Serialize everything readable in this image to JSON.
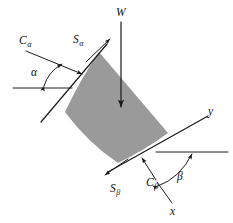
{
  "figure": {
    "background_color": "#ffffff",
    "line_color": "#1a1a1a",
    "wedge_fill_color": "#9a9a9a"
  },
  "labels": {
    "weight": "W",
    "shear_alpha_main": "S",
    "shear_alpha_sub": "α",
    "cohesion_alpha_main": "C",
    "cohesion_alpha_sub": "α",
    "shear_beta_main": "S",
    "shear_beta_sub": "β",
    "cohesion_beta_main": "C",
    "cohesion_beta_sub": "β",
    "angle_alpha": "α",
    "angle_beta": "β",
    "axis_x": "x",
    "axis_y": "y"
  },
  "elements": {
    "weight_force": {
      "name": "W",
      "description": "Vertical downward weight vector through wedge centroid",
      "direction": "down"
    },
    "shear_alpha": {
      "name": "Sα",
      "description": "Shear force along upper-left failure plane",
      "direction": "up-right"
    },
    "cohesion_alpha": {
      "name": "Cα",
      "description": "Cohesion force on upper-left plane",
      "direction": "down-right"
    },
    "shear_beta": {
      "name": "Sβ",
      "description": "Shear force along lower-right failure plane",
      "direction": "down-left"
    },
    "cohesion_beta": {
      "name": "Cβ",
      "description": "Cohesion force on lower-right plane",
      "direction": "up-left"
    },
    "angle_alpha": {
      "name": "α",
      "description": "Inclination angle of upper-left plane from horizontal"
    },
    "angle_beta": {
      "name": "β",
      "description": "Inclination angle of lower-right plane from horizontal"
    },
    "axes": {
      "x_label": "x",
      "y_label": "y",
      "description": "Local coordinate axes at lower-right plane"
    }
  }
}
